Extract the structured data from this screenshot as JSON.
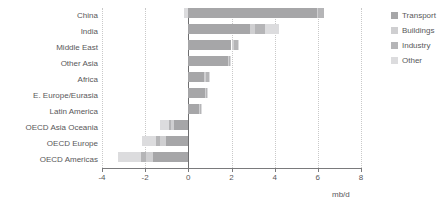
{
  "chart_data": {
    "type": "bar",
    "orientation": "horizontal",
    "stacked": true,
    "title": "",
    "xlabel": "mb/d",
    "ylabel": "",
    "xlim": [
      -4,
      8
    ],
    "xticks": [
      -4,
      -2,
      0,
      2,
      4,
      6,
      8
    ],
    "xticklabels": [
      "-4",
      "-2",
      "0",
      "2",
      "4",
      "6",
      "8"
    ],
    "grid": "vertical-dotted",
    "legend_position": "right",
    "categories": [
      "China",
      "India",
      "Middle East",
      "Other Asia",
      "Africa",
      "E. Europe/Eurasia",
      "Latin America",
      "OECD Asia Oceania",
      "OECD Europe",
      "OECD Americas"
    ],
    "series": [
      {
        "name": "Transport",
        "color": "#a6a6a8",
        "values": [
          5.95,
          2.85,
          2.0,
          1.85,
          0.72,
          0.75,
          0.48,
          -0.68,
          -1.05,
          -1.65
        ]
      },
      {
        "name": "Buildings",
        "color": "#cfcfd1",
        "values": [
          0.05,
          0.25,
          0.1,
          0.05,
          0.1,
          0.05,
          0.05,
          -0.12,
          -0.25,
          -0.3
        ]
      },
      {
        "name": "Industry",
        "color": "#b5b5b7",
        "values": [
          0.3,
          0.45,
          0.18,
          0.05,
          0.12,
          0.08,
          0.08,
          -0.1,
          -0.2,
          -0.22
        ]
      },
      {
        "name": "Other",
        "color": "#dcdcde",
        "values": [
          -0.2,
          0.65,
          0.05,
          0.02,
          0.08,
          0.02,
          0.02,
          -0.42,
          -0.65,
          -1.1
        ]
      }
    ],
    "totals": [
      6.3,
      4.2,
      2.33,
      1.97,
      1.02,
      0.9,
      0.63,
      -1.32,
      -2.15,
      -3.27
    ],
    "units": "mb/d"
  },
  "legend": {
    "items": [
      {
        "label": "Transport",
        "color": "#a6a6a8"
      },
      {
        "label": "Buildings",
        "color": "#cfcfd1"
      },
      {
        "label": "Industry",
        "color": "#b5b5b7"
      },
      {
        "label": "Other",
        "color": "#dcdcde"
      }
    ]
  },
  "axis": {
    "x_title": "mb/d"
  }
}
